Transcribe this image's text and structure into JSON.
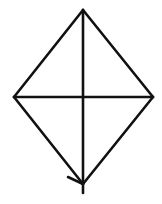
{
  "diagram": {
    "type": "kite-diagram",
    "stroke_color": "#111111",
    "background_color": "#ffffff",
    "stroke_width": 2.6,
    "vertices": {
      "top": [
        83,
        10
      ],
      "left": [
        14,
        97
      ],
      "right": [
        153,
        97
      ],
      "bottom": [
        83,
        184
      ]
    },
    "vertical_line": {
      "x": 83,
      "y1": 10,
      "y2": 193
    },
    "horizontal_line": {
      "y": 97,
      "x1": 14,
      "x2": 153
    },
    "arrowhead": {
      "tip": [
        83,
        184
      ],
      "wing": [
        68,
        177
      ]
    }
  }
}
